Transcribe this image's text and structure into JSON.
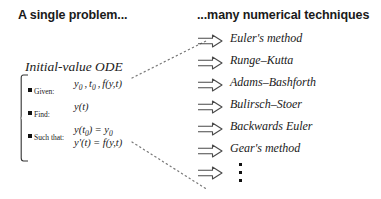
{
  "headers": {
    "left": "A single problem...",
    "right": "...many numerical techniques"
  },
  "problem": {
    "title": "Initial-value ODE",
    "rows": [
      {
        "label": "Given:"
      },
      {
        "label": "Find:"
      },
      {
        "label": "Such that:"
      }
    ],
    "expressions": {
      "given_y0": "y",
      "given_y0_sub": "0",
      "given_sep1": ",",
      "given_t0": "t",
      "given_t0_sub": "0",
      "given_sep2": ",",
      "given_f": "f(y,t)",
      "find": "y(t)",
      "such_that_1_lhs": "y(t",
      "such_that_1_lhs_sub": "0",
      "such_that_1_lhs_close": ")",
      "such_that_1_eq": "=",
      "such_that_1_rhs": "y",
      "such_that_1_rhs_sub": "0",
      "such_that_2_lhs": "y'(t)",
      "such_that_2_eq": "=",
      "such_that_2_rhs": "f(y,t)"
    }
  },
  "techniques": [
    {
      "arrow": "double-right-arrow-icon",
      "label": "Euler's method"
    },
    {
      "arrow": "double-right-arrow-icon",
      "label": "Runge–Kutta"
    },
    {
      "arrow": "double-right-arrow-icon",
      "label": "Adams–Bashforth"
    },
    {
      "arrow": "double-right-arrow-icon",
      "label": "Bulirsch–Stoer"
    },
    {
      "arrow": "double-right-arrow-icon",
      "label": "Backwards Euler"
    },
    {
      "arrow": "double-right-arrow-icon",
      "label": "Gear's method"
    },
    {
      "arrow": "double-right-arrow-icon",
      "label": ""
    }
  ],
  "connectors": {
    "upper": "dotted-line-up-right",
    "lower": "dotted-line-down-right",
    "ellipsis": "vertical-ellipsis"
  },
  "colors": {
    "background": "#ffffff",
    "text": "#1a1a1a",
    "line": "#555555"
  }
}
